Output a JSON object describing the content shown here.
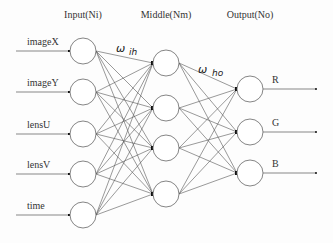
{
  "diagram": {
    "type": "neural-network",
    "layers": [
      {
        "id": "input",
        "title": "Input(Ni)",
        "x": 83,
        "nodes": [
          {
            "label": "imageX",
            "y": 51
          },
          {
            "label": "imageY",
            "y": 92
          },
          {
            "label": "lensU",
            "y": 134
          },
          {
            "label": "lensV",
            "y": 174
          },
          {
            "label": "time",
            "y": 215
          }
        ]
      },
      {
        "id": "middle",
        "title": "Middle(Nm)",
        "x": 166,
        "nodes": [
          {
            "y": 63
          },
          {
            "y": 108
          },
          {
            "y": 148
          },
          {
            "y": 194
          }
        ]
      },
      {
        "id": "output",
        "title": "Output(No)",
        "x": 250,
        "nodes": [
          {
            "label": "R",
            "y": 89
          },
          {
            "label": "G",
            "y": 132
          },
          {
            "label": "B",
            "y": 173
          }
        ]
      }
    ],
    "weights": {
      "input_to_middle": {
        "symbol": "ω",
        "subscript": "ih"
      },
      "middle_to_output": {
        "symbol": "ω",
        "subscript": "ho"
      }
    },
    "connections": "fully-connected",
    "colors": {
      "line": "#555555",
      "node_stroke": "#666666",
      "text": "#333333"
    }
  }
}
